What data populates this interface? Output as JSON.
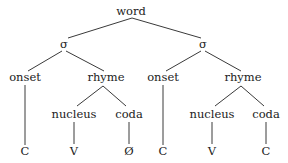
{
  "diagram": {
    "type": "syllable-structure-tree",
    "colors": {
      "line": "#3a3a3a",
      "text": "#222222",
      "background": "#ffffff"
    },
    "nodes": [
      {
        "id": "word",
        "label": "word",
        "x": 131,
        "y": 12
      },
      {
        "id": "s1",
        "label": "σ",
        "x": 64,
        "y": 45
      },
      {
        "id": "s2",
        "label": "σ",
        "x": 203,
        "y": 45
      },
      {
        "id": "onset1",
        "label": "onset",
        "x": 25,
        "y": 78
      },
      {
        "id": "rhyme1",
        "label": "rhyme",
        "x": 106,
        "y": 78
      },
      {
        "id": "onset2",
        "label": "onset",
        "x": 163,
        "y": 78
      },
      {
        "id": "rhyme2",
        "label": "rhyme",
        "x": 243,
        "y": 78
      },
      {
        "id": "nucleus1",
        "label": "nucleus",
        "x": 74,
        "y": 115
      },
      {
        "id": "coda1",
        "label": "coda",
        "x": 129,
        "y": 115
      },
      {
        "id": "nucleus2",
        "label": "nucleus",
        "x": 212,
        "y": 115
      },
      {
        "id": "coda2",
        "label": "coda",
        "x": 266,
        "y": 115
      },
      {
        "id": "c1",
        "label": "C",
        "x": 25,
        "y": 152
      },
      {
        "id": "v1",
        "label": "V",
        "x": 74,
        "y": 152
      },
      {
        "id": "null1",
        "label": "Ø",
        "x": 129,
        "y": 152
      },
      {
        "id": "c2",
        "label": "C",
        "x": 163,
        "y": 152
      },
      {
        "id": "v2",
        "label": "V",
        "x": 212,
        "y": 152
      },
      {
        "id": "c3",
        "label": "C",
        "x": 266,
        "y": 152
      }
    ],
    "edges": [
      {
        "from": "word",
        "to": "s1",
        "x1": 132,
        "y1": 18,
        "x2": 68,
        "y2": 38
      },
      {
        "from": "word",
        "to": "s2",
        "x1": 132,
        "y1": 18,
        "x2": 201,
        "y2": 38
      },
      {
        "from": "s1",
        "to": "onset1",
        "x1": 62,
        "y1": 51,
        "x2": 28,
        "y2": 71
      },
      {
        "from": "s1",
        "to": "rhyme1",
        "x1": 66,
        "y1": 51,
        "x2": 104,
        "y2": 71
      },
      {
        "from": "s2",
        "to": "onset2",
        "x1": 201,
        "y1": 51,
        "x2": 166,
        "y2": 71
      },
      {
        "from": "s2",
        "to": "rhyme2",
        "x1": 205,
        "y1": 51,
        "x2": 241,
        "y2": 71
      },
      {
        "from": "onset1",
        "to": "c1",
        "x1": 25,
        "y1": 85,
        "x2": 25,
        "y2": 145
      },
      {
        "from": "onset2",
        "to": "c2",
        "x1": 163,
        "y1": 85,
        "x2": 163,
        "y2": 145
      },
      {
        "from": "rhyme1",
        "to": "nucleus1",
        "x1": 103,
        "y1": 86,
        "x2": 77,
        "y2": 106
      },
      {
        "from": "rhyme1",
        "to": "coda1",
        "x1": 103,
        "y1": 86,
        "x2": 126,
        "y2": 106
      },
      {
        "from": "rhyme2",
        "to": "nucleus2",
        "x1": 241,
        "y1": 86,
        "x2": 215,
        "y2": 106
      },
      {
        "from": "rhyme2",
        "to": "coda2",
        "x1": 241,
        "y1": 86,
        "x2": 264,
        "y2": 106
      },
      {
        "from": "nucleus1",
        "to": "v1",
        "x1": 74,
        "y1": 122,
        "x2": 74,
        "y2": 144
      },
      {
        "from": "coda1",
        "to": "null1",
        "x1": 129,
        "y1": 122,
        "x2": 129,
        "y2": 144
      },
      {
        "from": "nucleus2",
        "to": "v2",
        "x1": 212,
        "y1": 122,
        "x2": 212,
        "y2": 144
      },
      {
        "from": "coda2",
        "to": "c3",
        "x1": 266,
        "y1": 122,
        "x2": 266,
        "y2": 144
      }
    ]
  }
}
